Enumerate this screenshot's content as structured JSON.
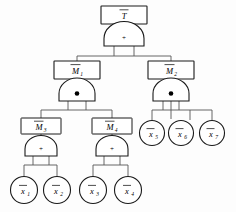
{
  "diagram": {
    "type": "fault-tree",
    "nodes": {
      "top_event": {
        "label": "T",
        "overbar": true,
        "shape": "rectangle",
        "name": "top-event-box"
      },
      "m1": {
        "label": "M",
        "sub": "1",
        "overbar": true,
        "shape": "rectangle"
      },
      "m2": {
        "label": "M",
        "sub": "2",
        "overbar": true,
        "shape": "rectangle"
      },
      "m3": {
        "label": "M",
        "sub": "3",
        "overbar": true,
        "shape": "rectangle"
      },
      "m4": {
        "label": "M",
        "sub": "4",
        "overbar": true,
        "shape": "rectangle"
      },
      "x1": {
        "label": "x",
        "sub": "1",
        "overbar": true,
        "shape": "circle"
      },
      "x2": {
        "label": "x",
        "sub": "2",
        "overbar": true,
        "shape": "circle"
      },
      "x3": {
        "label": "x",
        "sub": "3",
        "overbar": true,
        "shape": "circle"
      },
      "x4": {
        "label": "x",
        "sub": "4",
        "overbar": true,
        "shape": "circle"
      },
      "x5": {
        "label": "x",
        "sub": "5",
        "overbar": true,
        "shape": "circle"
      },
      "x6": {
        "label": "x",
        "sub": "6",
        "overbar": true,
        "shape": "circle"
      },
      "x7": {
        "label": "x",
        "sub": "7",
        "overbar": true,
        "shape": "circle"
      }
    },
    "gates": {
      "g_top": {
        "symbol": "+",
        "type": "OR",
        "parent": "T",
        "children": [
          "M1",
          "M2"
        ]
      },
      "g_m1": {
        "symbol": "●",
        "type": "AND",
        "parent": "M1",
        "children": [
          "M3",
          "M4"
        ]
      },
      "g_m2": {
        "symbol": "●",
        "type": "AND",
        "parent": "M2",
        "children": [
          "x5",
          "x6",
          "x7"
        ]
      },
      "g_m3": {
        "symbol": "+",
        "type": "OR",
        "parent": "M3",
        "children": [
          "x1",
          "x2"
        ]
      },
      "g_m4": {
        "symbol": "+",
        "type": "OR",
        "parent": "M4",
        "children": [
          "x3",
          "x4"
        ]
      }
    },
    "colors": {
      "stroke": "#1a1a1a",
      "wire": "#555555",
      "fill": "#ffffff",
      "background": "#fdfdfd"
    }
  }
}
